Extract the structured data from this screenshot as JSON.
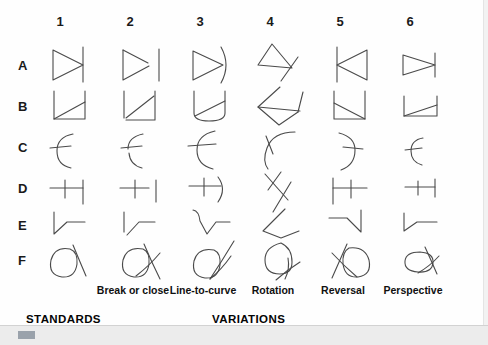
{
  "figure": {
    "title_standards": "STANDARDS",
    "title_variations": "VARIATIONS",
    "column_numbers": [
      "1",
      "2",
      "3",
      "4",
      "5",
      "6"
    ],
    "row_letters": [
      "A",
      "B",
      "C",
      "D",
      "E",
      "F"
    ],
    "column_captions": [
      "",
      "Break or close",
      "Line-to-curve",
      "Rotation",
      "Reversal",
      "Perspective"
    ],
    "stroke_color": "#4a4a4a",
    "text_color": "#101010",
    "background_color": "#fefefe",
    "band_color": "#ececec",
    "accent_color": "#9aa2ab",
    "cells": [
      {
        "row": "A",
        "col": "1",
        "glyph": "triangle-right-with-vertical-line"
      },
      {
        "row": "A",
        "col": "2",
        "glyph": "triangle-right-with-detached-vertical-line"
      },
      {
        "row": "A",
        "col": "3",
        "glyph": "triangle-right-with-arc"
      },
      {
        "row": "A",
        "col": "4",
        "glyph": "rotated-triangle-with-crossing-line"
      },
      {
        "row": "A",
        "col": "5",
        "glyph": "triangle-left-with-vertical-line"
      },
      {
        "row": "A",
        "col": "6",
        "glyph": "flattened-triangle-right-with-vertical-line"
      },
      {
        "row": "B",
        "col": "1",
        "glyph": "open-box-with-rising-diagonal"
      },
      {
        "row": "B",
        "col": "2",
        "glyph": "open-box-broken-with-rising-diagonal"
      },
      {
        "row": "B",
        "col": "3",
        "glyph": "open-box-curved-base-with-rising-diagonal"
      },
      {
        "row": "B",
        "col": "4",
        "glyph": "rotated-open-box-with-diagonal"
      },
      {
        "row": "B",
        "col": "5",
        "glyph": "open-box-with-falling-diagonal"
      },
      {
        "row": "B",
        "col": "6",
        "glyph": "flattened-open-box-with-rising-diagonal"
      },
      {
        "row": "C",
        "col": "1",
        "glyph": "left-arc-with-horizontal-tick"
      },
      {
        "row": "C",
        "col": "2",
        "glyph": "broken-left-arc-with-horizontal-tick"
      },
      {
        "row": "C",
        "col": "3",
        "glyph": "left-arc-with-long-horizontal-tick"
      },
      {
        "row": "C",
        "col": "4",
        "glyph": "rotated-arc-with-tick"
      },
      {
        "row": "C",
        "col": "5",
        "glyph": "right-arc-with-horizontal-tick"
      },
      {
        "row": "C",
        "col": "6",
        "glyph": "compressed-left-arc-with-tick"
      },
      {
        "row": "D",
        "col": "1",
        "glyph": "horizontal-line-with-tick-and-vertical-bar"
      },
      {
        "row": "D",
        "col": "2",
        "glyph": "horizontal-line-with-tick-and-detached-bar"
      },
      {
        "row": "D",
        "col": "3",
        "glyph": "horizontal-line-with-tick-and-arc"
      },
      {
        "row": "D",
        "col": "4",
        "glyph": "rotated-line-with-tick-and-bar"
      },
      {
        "row": "D",
        "col": "5",
        "glyph": "vertical-bar-left-with-tick-and-horizontal-line"
      },
      {
        "row": "D",
        "col": "6",
        "glyph": "compressed-line-with-tick-and-bar"
      },
      {
        "row": "E",
        "col": "1",
        "glyph": "vertical-down-zigzag-to-horizontal"
      },
      {
        "row": "E",
        "col": "2",
        "glyph": "broken-vertical-down-zigzag-to-horizontal"
      },
      {
        "row": "E",
        "col": "3",
        "glyph": "curved-vertical-down-zigzag-to-horizontal"
      },
      {
        "row": "E",
        "col": "4",
        "glyph": "rotated-zigzag"
      },
      {
        "row": "E",
        "col": "5",
        "glyph": "mirrored-zigzag-horizontal-to-vertical-down"
      },
      {
        "row": "E",
        "col": "6",
        "glyph": "compressed-zigzag"
      },
      {
        "row": "F",
        "col": "1",
        "glyph": "loop-with-crossing-stroke"
      },
      {
        "row": "F",
        "col": "2",
        "glyph": "loop-with-long-crossing-stroke"
      },
      {
        "row": "F",
        "col": "3",
        "glyph": "loop-with-extended-crossing-stroke"
      },
      {
        "row": "F",
        "col": "4",
        "glyph": "rotated-loop-with-stroke"
      },
      {
        "row": "F",
        "col": "5",
        "glyph": "mirrored-loop-with-stroke"
      },
      {
        "row": "F",
        "col": "6",
        "glyph": "flattened-loop-with-stroke"
      }
    ]
  }
}
